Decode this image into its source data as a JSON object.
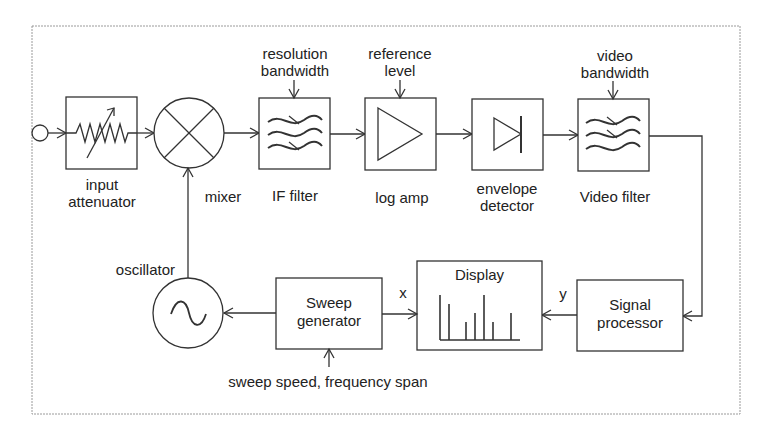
{
  "diagram": {
    "blocks": {
      "input_attenuator": {
        "label": "input\nattenuator",
        "line1": "input",
        "line2": "attenuator"
      },
      "mixer": {
        "label": "mixer"
      },
      "if_filter": {
        "label": "IF filter",
        "control": {
          "line1": "resolution",
          "line2": "bandwidth"
        }
      },
      "log_amp": {
        "label": "log amp",
        "control": {
          "line1": "reference",
          "line2": "level"
        }
      },
      "envelope_detector": {
        "line1": "envelope",
        "line2": "detector"
      },
      "video_filter": {
        "label": "Video filter",
        "control": {
          "line1": "video",
          "line2": "bandwidth"
        }
      },
      "signal_processor": {
        "line1": "Signal",
        "line2": "processor"
      },
      "display": {
        "label": "Display",
        "bars": [
          38,
          33,
          16,
          24,
          38,
          16,
          24
        ]
      },
      "sweep_generator": {
        "line1": "Sweep",
        "line2": "generator",
        "control": "sweep speed, frequency span"
      },
      "oscillator": {
        "label": "oscillator"
      }
    },
    "signals": {
      "x": "x",
      "y": "y"
    },
    "colors": {
      "line": "#333333",
      "frame": "#9a9a9a",
      "background": "#ffffff"
    }
  }
}
